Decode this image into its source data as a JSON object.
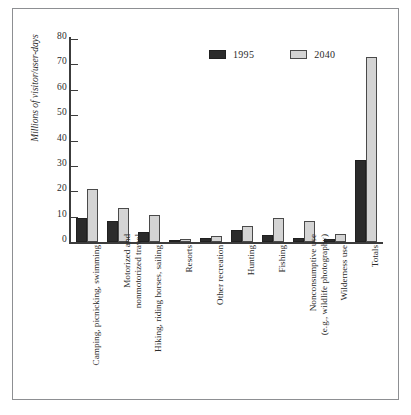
{
  "chart_data": {
    "type": "bar",
    "title": "",
    "xlabel": "",
    "ylabel": "Millions of visitor/user-days",
    "ylim": [
      0,
      80
    ],
    "yticks": [
      0,
      10,
      20,
      30,
      40,
      50,
      60,
      70,
      80
    ],
    "grid": false,
    "legend_position": "top-center",
    "categories": [
      "Camping, picnicking, swimming",
      "Motorized and nonmotorized travel",
      "Hiking, riding horses, sailing",
      "Resorts",
      "Other recreation",
      "Hunting",
      "Fishing",
      "Nonconsumptive use (e.g., wildlife photography)",
      "Wilderness use",
      "Totals"
    ],
    "category_lines": [
      [
        "Camping, picnicking, swimming"
      ],
      [
        "Motorized and",
        "nonmotorized travel"
      ],
      [
        "Hiking, riding horses, sailing"
      ],
      [
        "Resorts"
      ],
      [
        "Other recreation"
      ],
      [
        "Hunting"
      ],
      [
        "Fishing"
      ],
      [
        "Nonconsumptive use",
        "(e.g., wildlife photography)"
      ],
      [
        "Wilderness use"
      ],
      [
        "Totals"
      ]
    ],
    "series": [
      {
        "name": "1995",
        "color": "#2b2b2b",
        "values": [
          9.5,
          8.4,
          3.9,
          0.6,
          1.5,
          4.6,
          2.9,
          1.7,
          1.2,
          32.5
        ]
      },
      {
        "name": "2040",
        "color": "#d4d4d4",
        "values": [
          20.7,
          13.3,
          10.6,
          1.0,
          2.3,
          6.3,
          9.5,
          8.1,
          3.2,
          73.0
        ]
      }
    ]
  },
  "legend": {
    "items": [
      {
        "label": "1995",
        "swatch": "dark-swatch-icon"
      },
      {
        "label": "2040",
        "swatch": "light-swatch-icon"
      }
    ]
  },
  "axis": {
    "y_title": "Millions of visitor/user-days",
    "y_tick_labels": [
      "0",
      "10",
      "20",
      "30",
      "40",
      "50",
      "60",
      "70",
      "80"
    ]
  },
  "colors": {
    "series_1995": "#2b2b2b",
    "series_2040": "#d4d4d4",
    "axis": "#3c3c3c",
    "frame": "#8d8f92",
    "text": "#2b2b2b",
    "background": "#ffffff"
  }
}
